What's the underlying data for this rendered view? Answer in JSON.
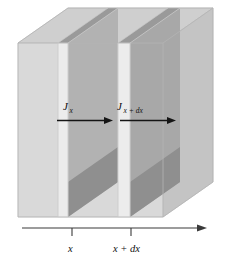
{
  "figure": {
    "type": "diagram",
    "background_color": "#ffffff",
    "colors": {
      "front_face": "#d9d9d9",
      "front_face_light": "#e4e4e4",
      "slab_face": "#b2b2b2",
      "slab_face_dark": "#a8a8a8",
      "top_face": "#cfcfcf",
      "top_face_shadow": "#9a9a9a",
      "side_face": "#c4c4c4",
      "bottom_shadow": "#8f8f8f",
      "strip_highlight": "#ececec",
      "outline": "#b8b8b8",
      "ink": "#1a1a1a"
    },
    "flux_arrows": [
      {
        "name": "J_x",
        "label_main": "J",
        "label_sub": "x",
        "label_x": 63,
        "label_y": 108,
        "arrow_x1": 57,
        "arrow_x2": 112,
        "arrow_y": 120
      },
      {
        "name": "J_x+dx",
        "label_main": "J",
        "label_sub": "x + dx",
        "label_x": 118,
        "label_y": 108,
        "arrow_x1": 120,
        "arrow_x2": 175,
        "arrow_y": 120
      }
    ],
    "axis": {
      "name": "x-axis",
      "x_start": 22,
      "x_end": 206,
      "y": 228,
      "ticks": [
        {
          "label": "x",
          "x": 72
        },
        {
          "label": "x + dx",
          "x": 131
        }
      ],
      "tick_label_y": 250
    },
    "slabs": [
      {
        "name": "slab-x",
        "front_left": 58,
        "front_right": 68
      },
      {
        "name": "slab-x-plus-dx",
        "front_left": 118,
        "front_right": 130
      }
    ]
  }
}
